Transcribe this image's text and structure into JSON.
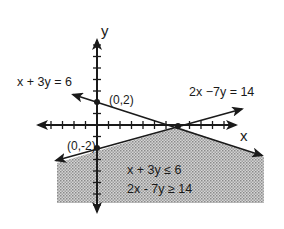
{
  "figure": {
    "axes": {
      "x_label": "x",
      "y_label": "y",
      "origin_px": [
        97,
        125
      ],
      "unit_px": 11.5,
      "x_ticks": [
        -6,
        -5,
        -4,
        -3,
        -2,
        -1,
        1,
        2,
        3,
        4,
        5,
        6,
        7,
        8,
        9,
        10,
        11,
        12
      ],
      "y_ticks": [
        -7,
        -6,
        -5,
        -4,
        -3,
        -2,
        -1,
        1,
        2,
        3,
        4,
        5,
        6,
        7
      ]
    },
    "lines": [
      {
        "equation": "x + 3y = 6",
        "label": "x + 3y = 6"
      },
      {
        "equation": "2x - 7y = 14",
        "label": "2x −7y = 14"
      }
    ],
    "points": [
      {
        "coords": [
          0,
          2
        ],
        "label": "(0,2)"
      },
      {
        "coords": [
          0,
          -2
        ],
        "label": "(0,-2)"
      },
      {
        "coords": [
          7,
          0
        ],
        "label": ""
      }
    ],
    "region": {
      "inequalities": [
        "x + 3y ≤ 6",
        "2x - 7y ≥ 14"
      ],
      "fill": "#bdbdbd"
    },
    "colors": {
      "ink": "#1a1a1a",
      "shade": "#bdbdbd",
      "background": "#ffffff"
    }
  }
}
